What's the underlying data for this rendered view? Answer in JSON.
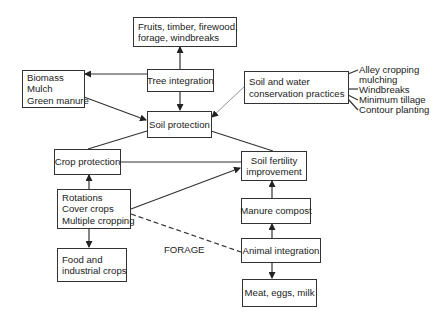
{
  "diagram": {
    "nodes": {
      "products_trees": [
        "Fruits, timber, firewood,",
        "forage, windbreaks"
      ],
      "tree_integration": "Tree integration",
      "biomass": [
        "Biomass",
        "Mulch",
        "Green manure"
      ],
      "soil_protection": "Soil protection",
      "soil_water": [
        "Soil and water",
        "conservation practices"
      ],
      "crop_protection": "Crop protection",
      "rotations": [
        "Rotations",
        "Cover crops",
        "Multiple cropping"
      ],
      "food_crops": [
        "Food and",
        "industrial crops"
      ],
      "soil_fertility": [
        "Soil fertility",
        "improvement"
      ],
      "manure_compost": "Manure compost",
      "animal_integration": "Animal integration",
      "animal_products": "Meat, eggs, milk"
    },
    "practices_list": [
      "Alley cropping",
      "mulching",
      "Windbreaks",
      "Minimum tillage",
      "Contour planting"
    ],
    "edge_labels": {
      "forage": "FORAGE"
    },
    "edges": [
      {
        "from": "tree_integration",
        "to": "products_trees",
        "type": "arrow"
      },
      {
        "from": "tree_integration",
        "to": "biomass",
        "type": "arrow"
      },
      {
        "from": "tree_integration",
        "to": "soil_protection",
        "type": "arrow"
      },
      {
        "from": "biomass",
        "to": "soil_protection",
        "type": "arrow"
      },
      {
        "from": "soil_water",
        "to": "soil_protection",
        "type": "arrow"
      },
      {
        "from": "soil_protection",
        "to": "crop_protection",
        "type": "line"
      },
      {
        "from": "soil_protection",
        "to": "soil_fertility",
        "type": "line"
      },
      {
        "from": "crop_protection",
        "to": "soil_fertility",
        "type": "line"
      },
      {
        "from": "rotations",
        "to": "crop_protection",
        "type": "arrow"
      },
      {
        "from": "rotations",
        "to": "food_crops",
        "type": "arrow"
      },
      {
        "from": "rotations",
        "to": "soil_fertility",
        "type": "arrow"
      },
      {
        "from": "rotations",
        "to": "animal_integration",
        "type": "dashed",
        "label": "FORAGE"
      },
      {
        "from": "manure_compost",
        "to": "soil_fertility",
        "type": "arrow"
      },
      {
        "from": "animal_integration",
        "to": "manure_compost",
        "type": "arrow"
      },
      {
        "from": "animal_integration",
        "to": "animal_products",
        "type": "arrow"
      }
    ]
  }
}
